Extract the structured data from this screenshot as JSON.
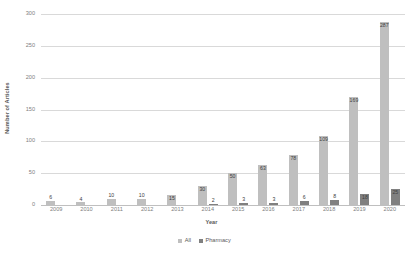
{
  "chart_data": {
    "type": "bar",
    "title": "",
    "subtitle": "",
    "xlabel": "Year",
    "ylabel": "Number of Articles",
    "categories": [
      "2009",
      "2010",
      "2011",
      "2012",
      "2013",
      "2014",
      "2015",
      "2016",
      "2017",
      "2018",
      "2019",
      "2020"
    ],
    "series": [
      {
        "name": "All",
        "color": "#bfbfbf",
        "values": [
          6,
          4,
          10,
          10,
          15,
          30,
          50,
          63,
          78,
          109,
          169,
          287
        ],
        "labels": [
          "6",
          "4",
          "10",
          "10",
          "15",
          "30",
          "50",
          "63",
          "78",
          "109",
          "169",
          "287"
        ]
      },
      {
        "name": "Pharmacy",
        "color": "#808080",
        "values": [
          0,
          0,
          0,
          0,
          0,
          2,
          3,
          3,
          6,
          8,
          18,
          25
        ],
        "labels": [
          "",
          "",
          "",
          "",
          "",
          "2",
          "3",
          "3",
          "6",
          "8",
          "18",
          "25"
        ]
      }
    ],
    "ylim": [
      0,
      300
    ],
    "yticks": [
      0,
      50,
      100,
      150,
      200,
      250,
      300
    ],
    "ytick_labels": [
      "0",
      "50",
      "100",
      "150",
      "200",
      "250",
      "300"
    ],
    "grid": true,
    "grid_color": "#d9d9d9",
    "legend_position": "bottom",
    "data_labels": true,
    "background": "#ffffff"
  }
}
